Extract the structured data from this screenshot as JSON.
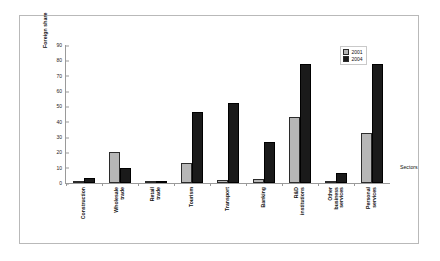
{
  "chart_data": {
    "type": "bar",
    "title": "",
    "xlabel": "Sectors",
    "ylabel": "Foreign share",
    "ylim": [
      0,
      90
    ],
    "yticks": [
      0,
      10,
      20,
      30,
      40,
      50,
      60,
      70,
      80,
      90
    ],
    "grid": false,
    "legend_position": "top-right",
    "categories": [
      "Construction",
      "Wholesale trade",
      "Retail trade",
      "Tourism",
      "Transport",
      "Banking",
      "R&D institutions",
      "Other business services",
      "Personal services"
    ],
    "series": [
      {
        "name": "2001",
        "color": "#b6b6b6",
        "values": [
          1.5,
          20,
          1.3,
          13,
          1.7,
          2.5,
          43,
          1,
          32.5
        ]
      },
      {
        "name": "2004",
        "color": "#1a1a1a",
        "values": [
          3,
          10,
          1.4,
          46,
          52.5,
          27,
          77.5,
          6.5,
          77.5
        ]
      }
    ]
  },
  "legend": {
    "items": [
      {
        "label": "2001"
      },
      {
        "label": "2004"
      }
    ]
  }
}
